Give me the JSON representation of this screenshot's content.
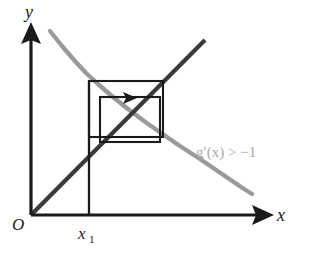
{
  "figure": {
    "kind": "cobweb-diagram",
    "title": "",
    "background_color": "#ffffff",
    "axes": {
      "x_label": "x",
      "y_label": "y",
      "origin_label": "O",
      "axis_color": "#1a1a1a",
      "x_axis": {
        "x_start": 31,
        "x_end": 258,
        "y": 215
      },
      "y_axis": {
        "x": 31,
        "y_start": 215,
        "y_end": 28
      }
    },
    "ticks": {
      "x": [
        {
          "label": "x",
          "subscript": "1",
          "value_x": 89
        }
      ]
    },
    "curves": {
      "identity": {
        "name": "y = x",
        "color": "#3a3a3a",
        "from": [
          31,
          215
        ],
        "to": [
          205,
          40
        ]
      },
      "g": {
        "name": "g(x)",
        "color": "#9a9a9a",
        "annotation": "g′(x) > −1",
        "annotation_color": "#a8a8a8",
        "annotation_x": 196,
        "annotation_y": 157,
        "points": [
          [
            50,
            31
          ],
          [
            62,
            46
          ],
          [
            74,
            60
          ],
          [
            86,
            73
          ],
          [
            99,
            85
          ],
          [
            113,
            97
          ],
          [
            128,
            109
          ],
          [
            144,
            121
          ],
          [
            161,
            133
          ],
          [
            180,
            146
          ],
          [
            200,
            159
          ],
          [
            222,
            174
          ],
          [
            244,
            189
          ],
          [
            252,
            194
          ]
        ]
      }
    },
    "cobweb": {
      "outer_box": {
        "x": 89,
        "y": 81,
        "width": 74,
        "height": 56
      },
      "inner_box": {
        "x": 100,
        "y": 97,
        "width": 60,
        "height": 45
      },
      "drop_line": {
        "x": 89,
        "y_top": 81,
        "y_bottom": 215
      },
      "arrow": {
        "name": "iteration-direction-arrow",
        "direction": "right",
        "tip_x": 137,
        "tip_y": 98
      }
    }
  }
}
